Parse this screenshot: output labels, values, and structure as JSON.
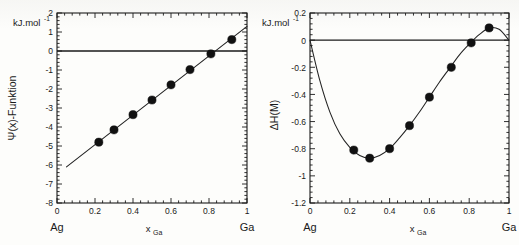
{
  "figure": {
    "background": "#fdfdfb",
    "ink": "#1a1a1a",
    "marker_color": "#111111",
    "line_color": "#222222"
  },
  "panels": [
    {
      "id": "left",
      "unit_label": "kJ.mol",
      "unit_exponent": "-1",
      "ylabel": "Ψ(x)-Funktion",
      "xlabel_base": "x",
      "xlabel_sub": "Ga",
      "left_endmember": "Ag",
      "right_endmember": "Ga",
      "yticks": [
        "2",
        "1",
        "0",
        "-1",
        "-2",
        "-3",
        "-4",
        "-5",
        "-6",
        "-7",
        "-8"
      ],
      "xticks": [
        "0",
        "0.2",
        "0.4",
        "0.6",
        "0.8",
        "1"
      ]
    },
    {
      "id": "right",
      "unit_label": "kJ.mol",
      "unit_exponent": "-1",
      "ylabel": "ΔH(M)",
      "xlabel_base": "x",
      "xlabel_sub": "Ga",
      "left_endmember": "Ag",
      "right_endmember": "Ga",
      "yticks": [
        "0.2",
        "0",
        "-0.2",
        "-0.4",
        "-0.6",
        "-0.8",
        "-1",
        "-1.2"
      ],
      "xticks": [
        "0",
        "0.2",
        "0.4",
        "0.6",
        "0.8",
        "1"
      ]
    }
  ],
  "chart_data": [
    {
      "type": "scatter",
      "title": "",
      "subtitle": "",
      "xlabel": "x_Ga",
      "ylabel": "Ψ(x)-Funktion",
      "unit": "kJ.mol^-1",
      "xlim": [
        0,
        1
      ],
      "ylim": [
        -8,
        2
      ],
      "xticks": [
        0,
        0.2,
        0.4,
        0.6,
        0.8,
        1
      ],
      "yticks": [
        -8,
        -7,
        -6,
        -5,
        -4,
        -3,
        -2,
        -1,
        0,
        1,
        2
      ],
      "grid": false,
      "legend": null,
      "zero_line": 0,
      "axis_endmembers": {
        "left": "Ag",
        "right": "Ga"
      },
      "series": [
        {
          "name": "Ψ(x) measured",
          "marker": "filled-circle",
          "x": [
            0.22,
            0.3,
            0.4,
            0.5,
            0.6,
            0.7,
            0.81,
            0.92
          ],
          "values": [
            -4.8,
            -4.15,
            -3.35,
            -2.58,
            -1.78,
            -0.98,
            -0.15,
            0.6
          ]
        },
        {
          "name": "linear fit",
          "marker": "line",
          "x": [
            0.05,
            1.0
          ],
          "values": [
            -6.1,
            1.3
          ]
        }
      ]
    },
    {
      "type": "line",
      "title": "",
      "subtitle": "",
      "xlabel": "x_Ga",
      "ylabel": "ΔH(M)",
      "unit": "kJ.mol^-1",
      "xlim": [
        0,
        1
      ],
      "ylim": [
        -1.2,
        0.2
      ],
      "xticks": [
        0,
        0.2,
        0.4,
        0.6,
        0.8,
        1
      ],
      "yticks": [
        -1.2,
        -1,
        -0.8,
        -0.6,
        -0.4,
        -0.2,
        0,
        0.2
      ],
      "grid": false,
      "legend": null,
      "zero_line": 0,
      "axis_endmembers": {
        "left": "Ag",
        "right": "Ga"
      },
      "series": [
        {
          "name": "ΔH(M) measured",
          "marker": "filled-circle",
          "x": [
            0.22,
            0.3,
            0.4,
            0.5,
            0.6,
            0.71,
            0.81,
            0.9
          ],
          "values": [
            -0.81,
            -0.87,
            -0.8,
            -0.63,
            -0.42,
            -0.2,
            -0.02,
            0.09
          ]
        },
        {
          "name": "fitted curve",
          "marker": "line",
          "x": [
            0.0,
            0.05,
            0.1,
            0.15,
            0.2,
            0.25,
            0.3,
            0.35,
            0.4,
            0.45,
            0.5,
            0.55,
            0.6,
            0.65,
            0.7,
            0.75,
            0.8,
            0.85,
            0.9,
            0.95,
            1.0
          ],
          "values": [
            0.0,
            -0.3,
            -0.53,
            -0.69,
            -0.79,
            -0.85,
            -0.87,
            -0.85,
            -0.8,
            -0.72,
            -0.63,
            -0.53,
            -0.42,
            -0.31,
            -0.21,
            -0.11,
            -0.03,
            0.04,
            0.09,
            0.08,
            0.0
          ]
        }
      ]
    }
  ]
}
